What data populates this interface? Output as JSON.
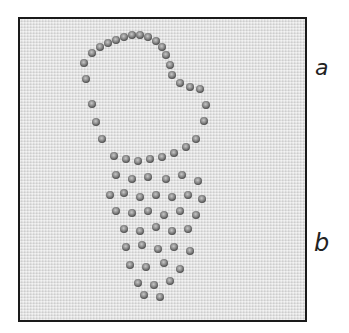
{
  "figure": {
    "labels": {
      "a": "a",
      "b": "b"
    },
    "colors": {
      "frame_border": "#1a1a1a",
      "fabric": "#e4e4e4",
      "thread": "#8a8a8a",
      "thread_dark": "#555555"
    }
  }
}
